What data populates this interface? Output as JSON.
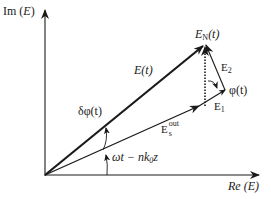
{
  "diagram": {
    "axes": {
      "y_label": "Im (E)",
      "y_label_prefix": "Im",
      "y_label_var": "E",
      "x_label": "Re (E)",
      "x_label_prefix": "Re",
      "x_label_var": "E"
    },
    "vectors": {
      "total_field": {
        "label": "E(t)",
        "name": "E",
        "arg": "(t)"
      },
      "noise_field": {
        "label": "E_N(t)",
        "name": "E",
        "sub": "N",
        "arg": "(t)"
      },
      "signal_out": {
        "label": "E_s^out",
        "name": "E",
        "sup": "out",
        "sub": "s"
      },
      "e1": {
        "label": "E_1",
        "name": "E",
        "sub": "1"
      },
      "e2": {
        "label": "E_2",
        "name": "E",
        "sub": "2"
      }
    },
    "angles": {
      "phase_fluctuation": {
        "label": "δφ(t)"
      },
      "noise_phase": {
        "label": "φ(t)"
      },
      "carrier_phase": {
        "label": "ωt − nk₀z",
        "part1": "ωt − ",
        "part2": "nk",
        "part2_sub": "0",
        "part3": "z"
      }
    },
    "colors": {
      "ink": "#1a1a1a",
      "background": "#ffffff"
    }
  }
}
